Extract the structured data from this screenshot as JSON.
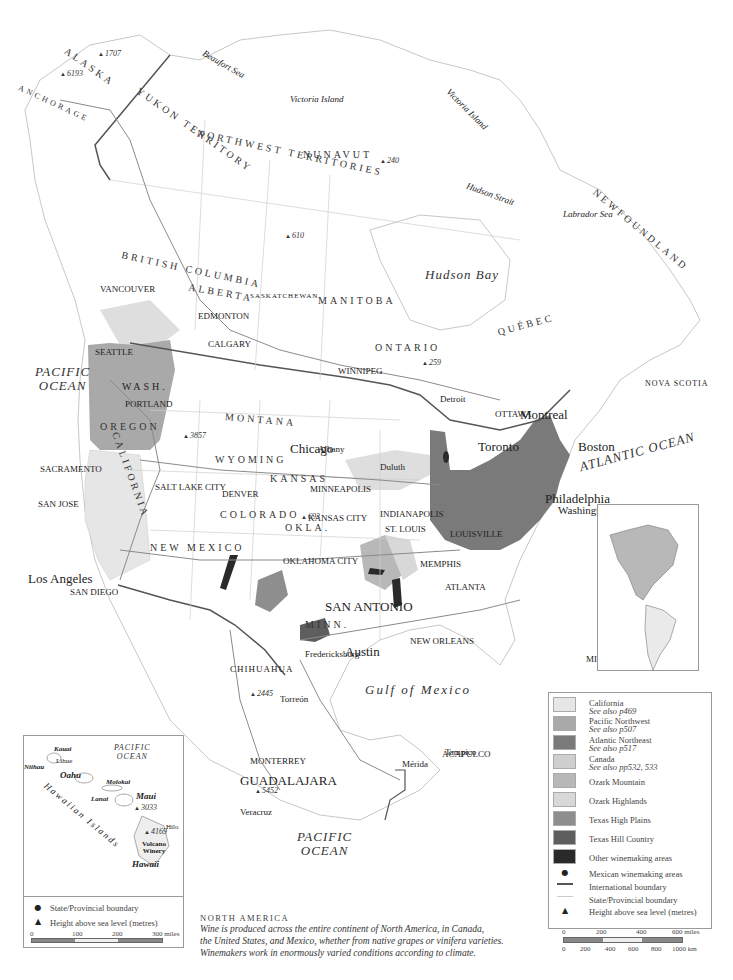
{
  "map": {
    "title": "NORTH AMERICA",
    "caption": [
      "Wine is produced across the entire continent of North America, in Canada,",
      "the United States, and Mexico, whether from native grapes or vinifera varieties.",
      "Winemakers work in enormously varied conditions according to climate."
    ],
    "colors": {
      "land": "#ffffff",
      "coast": "#c8c8c8",
      "state_boundary": "#cfcfcf",
      "international_boundary": "#555555",
      "road": "#8a8a8a",
      "california": "#e6e6e6",
      "pacific_northwest": "#a9a9a9",
      "atlantic_northeast": "#7a7a7a",
      "canada": "#cfcfcf",
      "ozark_mountain": "#b8b8b8",
      "ozark_highlands": "#d8d8d8",
      "texas_high_plains": "#8e8e8e",
      "texas_hill_country": "#5e5e5e",
      "other": "#2a2a2a"
    },
    "regions": {
      "states_provinces": [
        "ALASKA",
        "YUKON TERRITORY",
        "NORTHWEST TERRITORIES",
        "NUNAVUT",
        "BRITISH COLUMBIA",
        "ALBERTA",
        "SASKATCHEWAN",
        "MANITOBA",
        "ONTARIO",
        "QUÉBEC",
        "NEWFOUNDLAND",
        "N.B.",
        "P.E.I.",
        "NOVA SCOTIA",
        "WASH.",
        "OREGON",
        "CALIFORNIA",
        "IDAHO",
        "NEVADA",
        "UTAH",
        "ARIZONA",
        "MONTANA",
        "WYOMING",
        "COLORADO",
        "NEW MEXICO",
        "NORTH DAKOTA",
        "SOUTH DAKOTA",
        "NEBRASKA",
        "KANSAS",
        "OKLA.",
        "TEXAS",
        "MINN.",
        "IOWA",
        "MISSOURI",
        "ARK.",
        "LOUISIANA",
        "MISS.",
        "WISC.",
        "ILL.",
        "IND.",
        "OHIO",
        "MICH.",
        "KENTUCKY",
        "TENN.",
        "ALABAMA",
        "GEORGIA",
        "FLORIDA",
        "STH CAROLINA",
        "NTH CAROLINA",
        "VIRGINIA",
        "W. VA",
        "PENN.",
        "N.Y.",
        "VT.",
        "N.H.",
        "MAINE",
        "R.I.",
        "N.J.",
        "DEL.",
        "CHIHUAHUA"
      ],
      "water": [
        "PACIFIC OCEAN",
        "ATLANTIC OCEAN",
        "Hudson Bay",
        "Gulf of Mexico",
        "Beaufort Sea",
        "Labrador Sea",
        "Hudson Strait",
        "Great Bear L.",
        "Great Slave L.",
        "Lake Winnipeg",
        "Superior",
        "Huron",
        "Lake Michigan"
      ],
      "islands": [
        "Victoria Island",
        "Victoria Island"
      ]
    },
    "cities": [
      "ANCHORAGE",
      "Fairbanks",
      "Inuvik",
      "Dawson",
      "Whitehorse",
      "Skagway",
      "Yellowknife",
      "Fort Nelson",
      "Fort McMurray",
      "Prince Rupert",
      "Prince George",
      "Kamloops",
      "VANCOUVER",
      "Victoria",
      "SEATTLE",
      "Penticton",
      "Spokane",
      "PORTLAND",
      "Eugene",
      "Boise",
      "SACRAMENTO",
      "San Francisco",
      "SAN JOSE",
      "Reno",
      "Bakersfield",
      "Los Angeles",
      "SAN DIEGO",
      "Las Vegas",
      "SALT LAKE CITY",
      "EDMONTON",
      "CALGARY",
      "Great Falls",
      "Saskatoon",
      "Regina",
      "WINNIPEG",
      "Churchill",
      "Fort George",
      "Kuujjuaq",
      "Schefferville",
      "Goose Bay",
      "Sept-Îles",
      "St John's",
      "Halifax",
      "Kapuskasing",
      "Sudbury",
      "Albany",
      "Grand Forks",
      "Duluth",
      "Rapid City",
      "MINNEAPOLIS",
      "Lake Wisconsin",
      "MILWAUKEE",
      "Des Moines",
      "OMAHA",
      "Cheyenne",
      "DENVER",
      "Grand Valley",
      "Chicago",
      "Detroit",
      "Toronto",
      "OTTAWA",
      "Montreal",
      "QUÉBEC",
      "Portland",
      "Boston",
      "New York",
      "Philadelphia",
      "Washington D.C.",
      "CLEVELAND",
      "PITTSBURGH",
      "INDIANAPOLIS",
      "ST. LOUIS",
      "Hermann",
      "Augusta",
      "KANSAS CITY",
      "Wichita",
      "OKLAHOMA CITY",
      "Tulsa",
      "Altus",
      "Arkansas Mtn",
      "Little Rock",
      "LOUISVILLE",
      "MEMPHIS",
      "Mississippi Delta",
      "Birmingham",
      "ATLANTA",
      "Savannah",
      "Jacksonville",
      "Tampa",
      "St. Petersburg",
      "MIAMI",
      "NEW ORLEANS",
      "Houston",
      "Dallas",
      "Austin",
      "SAN ANTONIO",
      "Bell Mtn",
      "Fredericksburg",
      "Escondido Valley",
      "El Paso",
      "Mesilla Valley",
      "Mimbres Valley",
      "Middle Rio Grande",
      "Albuquerque",
      "PHOENIX",
      "Nogales",
      "Caborca",
      "Hermosillo",
      "Northern Baja California",
      "Delicias",
      "Laguna",
      "Torreón",
      "Parras",
      "Saltillo",
      "MONTERREY",
      "Zacatecas",
      "Aguascalientes",
      "GUADALAJARA",
      "San Juan del Río",
      "Mexico City",
      "Veracruz",
      "Oaxaca",
      "ACAPULCO",
      "Tampico",
      "Mérida",
      "Cancún",
      "Villahermosa",
      "La Paz",
      "Culiacán",
      "Mazatlán"
    ],
    "peaks": [
      "1707",
      "6193",
      "472",
      "2966",
      "240",
      "610",
      "747",
      "747",
      "305",
      "259",
      "4042",
      "3857",
      "4316",
      "4154",
      "3982",
      "2088",
      "693",
      "1976",
      "477",
      "2389",
      "2445",
      "3200",
      "3055",
      "5452"
    ],
    "hawaii_inset": {
      "ocean": [
        "PACIFIC",
        "OCEAN"
      ],
      "chain_label": "Hawaiian Islands",
      "islands": [
        "Kauai",
        "Niihau",
        "Oahu",
        "Molokai",
        "Lanai",
        "Maui",
        "Hawaii"
      ],
      "places": [
        "Lihue",
        "Hilo",
        "Volcano Winery"
      ],
      "peaks": [
        "3033",
        "4169"
      ],
      "legend": [
        {
          "symbol": "dot",
          "label": "State/Provincial boundary"
        },
        {
          "symbol": "triangle",
          "label": "Height above sea level (metres)"
        }
      ],
      "scale_miles": [
        "0",
        "100",
        "200",
        "300 miles"
      ],
      "scale_km": [
        "0",
        "100",
        "200",
        "300",
        "400",
        "500 km"
      ]
    },
    "legend": {
      "swatches": [
        {
          "label": "California",
          "sub": "See also p469",
          "color_key": "california"
        },
        {
          "label": "Pacific Northwest",
          "sub": "See also p507",
          "color_key": "pacific_northwest"
        },
        {
          "label": "Atlantic Northeast",
          "sub": "See also p517",
          "color_key": "atlantic_northeast"
        },
        {
          "label": "Canada",
          "sub": "See also pp532, 533",
          "color_key": "canada"
        },
        {
          "label": "Ozark Mountain",
          "sub": "",
          "color_key": "ozark_mountain"
        },
        {
          "label": "Ozark Highlands",
          "sub": "",
          "color_key": "ozark_highlands"
        },
        {
          "label": "Texas High Plains",
          "sub": "",
          "color_key": "texas_high_plains"
        },
        {
          "label": "Texas Hill Country",
          "sub": "",
          "color_key": "texas_hill_country"
        },
        {
          "label": "Other winemaking areas",
          "sub": "",
          "color_key": "other"
        }
      ],
      "symbols": [
        {
          "symbol": "dot",
          "label": "Mexican winemaking areas"
        },
        {
          "symbol": "intl-line",
          "label": "International boundary"
        },
        {
          "symbol": "state-line",
          "label": "State/Provincial boundary"
        },
        {
          "symbol": "triangle",
          "label": "Height above sea level (metres)"
        }
      ],
      "scale_miles": [
        "0",
        "200",
        "400",
        "600 miles"
      ],
      "scale_km": [
        "0",
        "200",
        "400",
        "600",
        "800",
        "1000 km"
      ]
    }
  }
}
